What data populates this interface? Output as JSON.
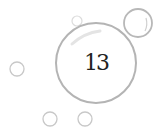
{
  "badge": {
    "number": "13"
  },
  "colors": {
    "ring": "#b8b8b8",
    "ring_light": "#d8d8d8",
    "text": "#222222",
    "background": "#ffffff"
  },
  "bubbles": [
    {
      "name": "main-bubble",
      "cx": 96,
      "cy": 63,
      "r": 40
    },
    {
      "name": "top-right-bubble",
      "cx": 138,
      "cy": 23,
      "r": 14
    },
    {
      "name": "top-small-bubble",
      "cx": 77,
      "cy": 21,
      "r": 5
    },
    {
      "name": "left-bubble",
      "cx": 17,
      "cy": 69,
      "r": 7
    },
    {
      "name": "bottom-left-bubble",
      "cx": 50,
      "cy": 119,
      "r": 7
    },
    {
      "name": "bottom-right-bubble",
      "cx": 85,
      "cy": 119,
      "r": 7
    }
  ]
}
